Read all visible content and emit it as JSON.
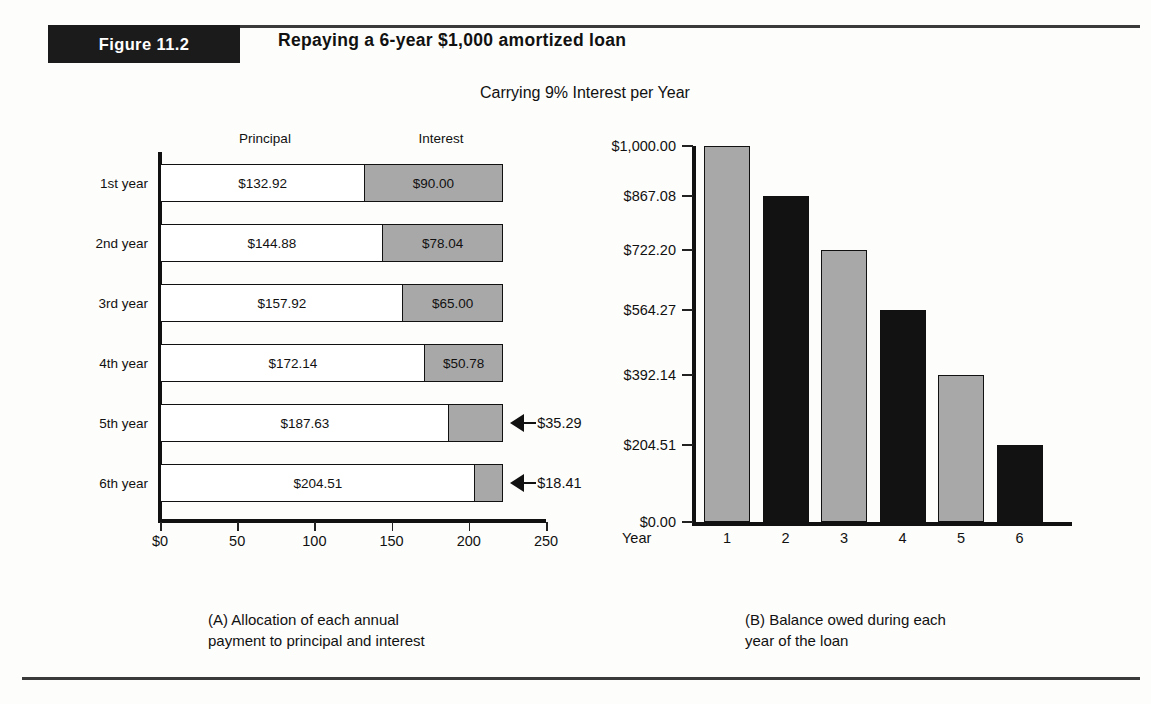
{
  "figure": {
    "badge": "Figure 11.2",
    "title": "Repaying a 6-year $1,000 amortized loan",
    "subtitle": "Carrying 9% Interest per Year"
  },
  "panel_a": {
    "caption": "(A) Allocation of each annual\n      payment to principal and interest",
    "col_headers": {
      "principal": "Principal",
      "interest": "Interest"
    },
    "row_labels": [
      "1st  year",
      "2nd  year",
      "3rd  year",
      "4th  year",
      "5th  year",
      "6th  year"
    ],
    "x_tick_labels": [
      "$0",
      "50",
      "100",
      "150",
      "200",
      "250"
    ],
    "principal_labels": [
      "$132.92",
      "$144.88",
      "$157.92",
      "$172.14",
      "$187.63",
      "$204.51"
    ],
    "interest_labels": [
      "$90.00",
      "$78.04",
      "$65.00",
      "$50.78",
      "$35.29",
      "$18.41"
    ],
    "callouts": [
      "$35.29",
      "$18.41"
    ]
  },
  "panel_b": {
    "caption": "(B) Balance owed during each\n      year of the loan",
    "y_tick_labels": [
      "$1,000.00",
      "$867.08",
      "$722.20",
      "$564.27",
      "$392.14",
      "$204.51",
      "$0.00"
    ],
    "x_axis_title": "Year",
    "x_tick_labels": [
      "1",
      "2",
      "3",
      "4",
      "5",
      "6"
    ]
  },
  "colors": {
    "interest_fill": "#a8a8a8",
    "principal_fill": "#ffffff",
    "bar_black": "#121212",
    "ink": "#111111",
    "page_bg": "#fdfdfb"
  },
  "chart_data": [
    {
      "type": "bar",
      "orientation": "horizontal",
      "stacked": true,
      "title": "(A) Allocation of each annual payment to principal and interest",
      "xlabel": "",
      "ylabel": "",
      "xlim": [
        0,
        250
      ],
      "grid": false,
      "legend": "column headers above bars",
      "categories": [
        "1st year",
        "2nd year",
        "3rd year",
        "4th year",
        "5th year",
        "6th year"
      ],
      "series": [
        {
          "name": "Principal",
          "values": [
            132.92,
            144.88,
            157.92,
            172.14,
            187.63,
            204.51
          ]
        },
        {
          "name": "Interest",
          "values": [
            90.0,
            78.04,
            65.0,
            50.78,
            35.29,
            18.41
          ]
        }
      ],
      "totals": [
        222.92,
        222.92,
        222.92,
        222.92,
        222.92,
        222.92
      ],
      "xticks": [
        0,
        50,
        100,
        150,
        200,
        250
      ],
      "annotations": [
        {
          "category": "5th year",
          "series": "Interest",
          "text": "$35.29"
        },
        {
          "category": "6th year",
          "series": "Interest",
          "text": "$18.41"
        }
      ]
    },
    {
      "type": "bar",
      "orientation": "vertical",
      "title": "(B) Balance owed during each year of the loan",
      "xlabel": "Year",
      "ylabel": "",
      "ylim": [
        0,
        1000
      ],
      "grid": false,
      "categories": [
        "1",
        "2",
        "3",
        "4",
        "5",
        "6"
      ],
      "values": [
        1000.0,
        867.08,
        722.2,
        564.27,
        392.14,
        204.51
      ],
      "yticks": [
        0,
        204.51,
        392.14,
        564.27,
        722.2,
        867.08,
        1000.0
      ],
      "ytick_labels": [
        "$0.00",
        "$204.51",
        "$392.14",
        "$564.27",
        "$722.20",
        "$867.08",
        "$1,000.00"
      ],
      "bar_colors": [
        "#a8a8a8",
        "#121212",
        "#a8a8a8",
        "#121212",
        "#a8a8a8",
        "#121212"
      ]
    }
  ]
}
